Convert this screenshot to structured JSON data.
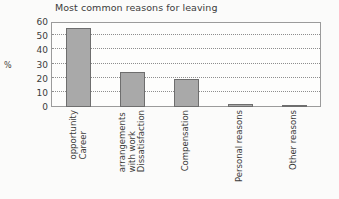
{
  "chart_data": {
    "type": "bar",
    "title": "Most common reasons for leaving",
    "xlabel": "",
    "ylabel": "%",
    "categories": [
      "Career opportunity",
      "Dissatisfaction with work arrangements",
      "Compensation",
      "Personal reasons",
      "Other reasons"
    ],
    "category_lines": [
      [
        "Career",
        "opportunity"
      ],
      [
        "Dissatisfaction",
        "with work",
        "arrangements"
      ],
      [
        "Compensation"
      ],
      [
        "Personal reasons"
      ],
      [
        "Other reasons"
      ]
    ],
    "values": [
      56,
      25,
      20,
      2,
      1.5
    ],
    "ylim": [
      0,
      60
    ],
    "yticks": [
      0,
      10,
      20,
      30,
      40,
      50,
      60
    ],
    "ytick_labels": [
      "0",
      "10",
      "20",
      "30",
      "40",
      "50",
      "60"
    ],
    "grid": true,
    "legend": false,
    "bar_color": "#a9a9a9",
    "bar_border_color": "#6e6e6e",
    "grid_color": "#8e8e8e",
    "frame_color": "#9b9b9b",
    "text_color": "#3b3b3b",
    "background_color": "#fbfbfa"
  }
}
